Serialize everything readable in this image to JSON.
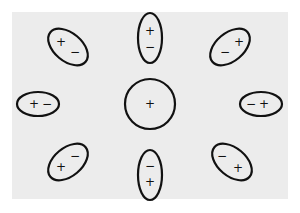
{
  "diagram": {
    "colors": {
      "background": "#ffffff",
      "panel": "#ececec",
      "stroke": "#111111"
    },
    "center": {
      "label": "+",
      "cx": 150,
      "cy": 104,
      "r": 25
    },
    "dipoles": [
      {
        "name": "top-left",
        "cx": 68,
        "cy": 47,
        "rx": 23,
        "ry": 14,
        "rot": 40,
        "a": {
          "label": "+",
          "x": 61,
          "y": 42
        },
        "b": {
          "label": "−",
          "x": 75,
          "y": 52
        }
      },
      {
        "name": "top",
        "cx": 150,
        "cy": 38,
        "rx": 12,
        "ry": 25,
        "rot": 0,
        "a": {
          "label": "+",
          "x": 150,
          "y": 31
        },
        "b": {
          "label": "−",
          "x": 150,
          "y": 47
        }
      },
      {
        "name": "top-right",
        "cx": 230,
        "cy": 47,
        "rx": 23,
        "ry": 14,
        "rot": -40,
        "a": {
          "label": "−",
          "x": 225,
          "y": 52
        },
        "b": {
          "label": "+",
          "x": 239,
          "y": 42
        }
      },
      {
        "name": "left",
        "cx": 38,
        "cy": 104,
        "rx": 21,
        "ry": 12,
        "rot": 0,
        "a": {
          "label": "+",
          "x": 34,
          "y": 104
        },
        "b": {
          "label": "−",
          "x": 47,
          "y": 104
        }
      },
      {
        "name": "right",
        "cx": 261,
        "cy": 104,
        "rx": 21,
        "ry": 12,
        "rot": 0,
        "a": {
          "label": "−",
          "x": 251,
          "y": 104
        },
        "b": {
          "label": "+",
          "x": 264,
          "y": 104
        }
      },
      {
        "name": "bottom-left",
        "cx": 68,
        "cy": 162,
        "rx": 23,
        "ry": 14,
        "rot": -40,
        "a": {
          "label": "−",
          "x": 75,
          "y": 156
        },
        "b": {
          "label": "+",
          "x": 61,
          "y": 167
        }
      },
      {
        "name": "bottom",
        "cx": 150,
        "cy": 175,
        "rx": 12,
        "ry": 25,
        "rot": 0,
        "a": {
          "label": "−",
          "x": 150,
          "y": 166
        },
        "b": {
          "label": "+",
          "x": 150,
          "y": 182
        }
      },
      {
        "name": "bottom-right",
        "cx": 232,
        "cy": 162,
        "rx": 23,
        "ry": 14,
        "rot": 40,
        "a": {
          "label": "−",
          "x": 222,
          "y": 156
        },
        "b": {
          "label": "+",
          "x": 238,
          "y": 168
        }
      }
    ]
  }
}
